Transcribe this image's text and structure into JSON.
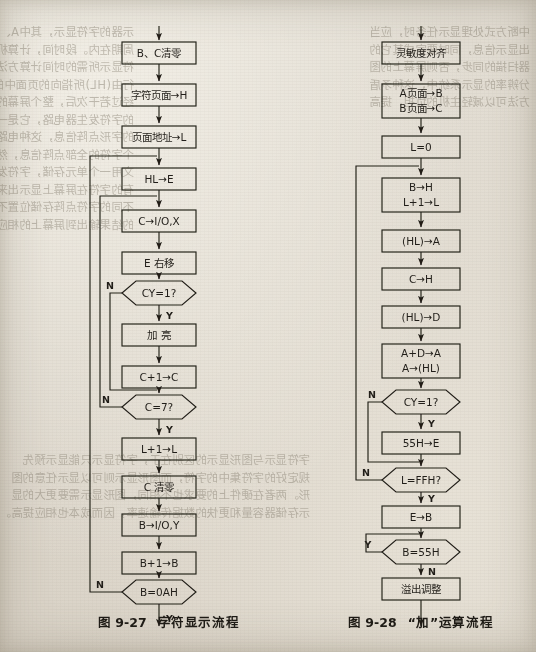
{
  "page": {
    "background_color": "#ded9cf",
    "ink_color": "#211e19",
    "kind": "scanned-textbook-page-with-two-flowcharts"
  },
  "figures": [
    {
      "id": "fig-9-27",
      "caption_number": "图 9-27",
      "caption_title": "字符显示流程",
      "nodes": [
        {
          "key": "n1",
          "shape": "process",
          "text": [
            "B、C清零"
          ]
        },
        {
          "key": "n2",
          "shape": "process",
          "text": [
            "字符页面→H"
          ]
        },
        {
          "key": "n3",
          "shape": "process",
          "text": [
            "页面地址→L"
          ]
        },
        {
          "key": "n4",
          "shape": "process",
          "text": [
            "HL→E"
          ]
        },
        {
          "key": "n5",
          "shape": "process",
          "text": [
            "C→I/O,X"
          ]
        },
        {
          "key": "n6",
          "shape": "process",
          "text": [
            "E 右移"
          ]
        },
        {
          "key": "n7",
          "shape": "decision",
          "text": [
            "CY=1?"
          ]
        },
        {
          "key": "n8",
          "shape": "process",
          "text": [
            "加  亮"
          ]
        },
        {
          "key": "n9",
          "shape": "process",
          "text": [
            "C+1→C"
          ]
        },
        {
          "key": "n10",
          "shape": "decision",
          "text": [
            "C=7?"
          ]
        },
        {
          "key": "n11",
          "shape": "process",
          "text": [
            "L+1→L"
          ]
        },
        {
          "key": "n12",
          "shape": "process",
          "text": [
            "C 清零"
          ]
        },
        {
          "key": "n13",
          "shape": "process",
          "text": [
            "B→I/O,Y"
          ]
        },
        {
          "key": "n14",
          "shape": "process",
          "text": [
            "B+1→B"
          ]
        },
        {
          "key": "n15",
          "shape": "decision",
          "text": [
            "B=0AH"
          ]
        }
      ],
      "branch_labels": [
        {
          "at": "n7",
          "label": "N",
          "side": "left"
        },
        {
          "at": "n7",
          "label": "Y",
          "side": "bottom"
        },
        {
          "at": "n10",
          "label": "N",
          "side": "left"
        },
        {
          "at": "n10",
          "label": "Y",
          "side": "bottom"
        },
        {
          "at": "n15",
          "label": "N",
          "side": "left"
        },
        {
          "at": "n15",
          "label": "Y",
          "side": "bottom"
        }
      ]
    },
    {
      "id": "fig-9-28",
      "caption_number": "图 9-28",
      "caption_title": "“加”运算流程",
      "nodes": [
        {
          "key": "m1",
          "shape": "process",
          "text": [
            "灵敏度对齐"
          ]
        },
        {
          "key": "m2",
          "shape": "process",
          "text": [
            "A页面→B",
            "B页面→C"
          ]
        },
        {
          "key": "m3",
          "shape": "process",
          "text": [
            "L=0"
          ]
        },
        {
          "key": "m4",
          "shape": "process",
          "text": [
            "B→H",
            "L+1→L"
          ]
        },
        {
          "key": "m5",
          "shape": "process",
          "text": [
            "(HL)→A"
          ]
        },
        {
          "key": "m6",
          "shape": "process",
          "text": [
            "C→H"
          ]
        },
        {
          "key": "m7",
          "shape": "process",
          "text": [
            "(HL)→D"
          ]
        },
        {
          "key": "m8",
          "shape": "process",
          "text": [
            "A+D→A",
            "A→(HL)"
          ]
        },
        {
          "key": "m9",
          "shape": "decision",
          "text": [
            "CY=1?"
          ]
        },
        {
          "key": "m10",
          "shape": "process",
          "text": [
            "55H→E"
          ]
        },
        {
          "key": "m11",
          "shape": "decision",
          "text": [
            "L=FFH?"
          ]
        },
        {
          "key": "m12",
          "shape": "process",
          "text": [
            "E→B"
          ]
        },
        {
          "key": "m13",
          "shape": "decision",
          "text": [
            "B=55H"
          ]
        },
        {
          "key": "m14",
          "shape": "process",
          "text": [
            "溢出调整"
          ]
        }
      ],
      "branch_labels": [
        {
          "at": "m9",
          "label": "N",
          "side": "left"
        },
        {
          "at": "m9",
          "label": "Y",
          "side": "bottom"
        },
        {
          "at": "m11",
          "label": "N",
          "side": "left"
        },
        {
          "at": "m11",
          "label": "Y",
          "side": "bottom"
        },
        {
          "at": "m13",
          "label": "Y",
          "side": "left"
        },
        {
          "at": "m13",
          "label": "N",
          "side": "bottom"
        }
      ]
    }
  ],
  "bleed_text": {
    "note": "faint mirrored show-through of body copy surrounding the figures",
    "left_column": [
      "示器的字符显示，其中A、…、B、…，",
      "周期在内。段时间，计算机可有",
      "符显示所需的时间计算方法。如",
      "行由(HL)所指向的页面中的内容，",
      "经过若干次后，整个屏幕的字符",
      "的字符发生器电路，它是一个由",
      "的字形点阵信息，这种电路可由",
      "个字符的全部点阵信息，然后再",
      "文用一个单元存储，字符发生器",
      "有的字符在屏幕上显示出来。",
      "不同的字符点阵存储位置不同，",
      "的结果输出到屏幕上的相应位置"
    ],
    "right_column": [
      "中断方式处理显示任务时，应当",
      "出显示信息，同时要完成其它的",
      "器扫描的同步，否则屏幕上的图",
      "分辨率的显示系统中，这种矛盾",
      "方法可以减轻主机的负担，提高"
    ],
    "bottom_block": [
      "字符显示与图形显示的区别在于，字符显示只能显示预先",
      "规定好的字符集中的字符，而图形显示则可以显示任意的图",
      "形。两者在硬件上的要求也不相同，图形显示需要更大的显",
      "示存储器容量和更快的数据传输速率，因而成本也相应提高。"
    ]
  }
}
